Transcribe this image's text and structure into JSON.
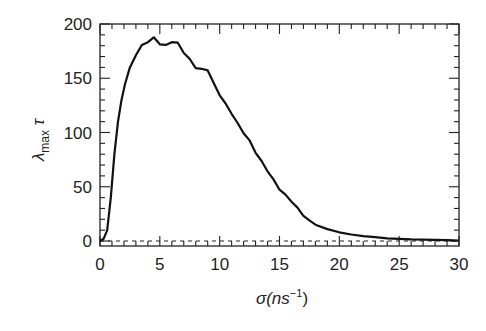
{
  "chart_data": {
    "type": "line",
    "title": "",
    "xlabel": "σ(ns⁻¹)",
    "xlabel_main": "σ(ns",
    "xlabel_sup": "−1",
    "xlabel_close": ")",
    "ylabel_main": "λ",
    "ylabel_sub": "max",
    "ylabel_tail": " τ",
    "ylabel": "λmax τ",
    "xlim": [
      0,
      30
    ],
    "ylim": [
      -5,
      200
    ],
    "xticks": [
      0,
      5,
      10,
      15,
      20,
      25,
      30
    ],
    "xtick_labels": [
      "0",
      "5",
      "10",
      "15",
      "20",
      "25",
      "30"
    ],
    "yticks": [
      0,
      50,
      100,
      150,
      200
    ],
    "ytick_labels": [
      "0",
      "50",
      "100",
      "150",
      "200"
    ],
    "grid": false,
    "legend": null,
    "reference_line": {
      "y": 0,
      "style": "dashed"
    },
    "series": [
      {
        "name": "λmax τ",
        "x": [
          0,
          0.3,
          0.6,
          0.9,
          1.2,
          1.5,
          1.8,
          2.1,
          2.5,
          3.0,
          3.5,
          4.0,
          4.5,
          5.0,
          5.5,
          6.0,
          6.5,
          7.0,
          7.5,
          8.0,
          8.5,
          9.0,
          9.5,
          10.0,
          10.5,
          11.0,
          11.5,
          12.0,
          12.5,
          13.0,
          13.5,
          14.0,
          14.5,
          15.0,
          15.5,
          16.0,
          16.5,
          17.0,
          17.5,
          18.0,
          19.0,
          20.0,
          21.0,
          22.0,
          23.0,
          24.0,
          25.0,
          26.0,
          27.0,
          28.0,
          29.0,
          30.0
        ],
        "values": [
          0,
          2,
          10,
          40,
          80,
          110,
          130,
          145,
          160,
          172,
          180,
          184,
          187,
          182,
          180,
          184,
          182,
          174,
          167,
          160,
          158,
          158,
          145,
          135,
          126,
          118,
          108,
          100,
          92,
          82,
          73,
          65,
          56,
          48,
          42,
          37,
          30,
          24,
          19,
          15,
          11,
          8,
          6,
          4.5,
          3.5,
          2.5,
          2,
          1.5,
          1.2,
          1,
          0.7,
          0.5
        ]
      }
    ]
  }
}
